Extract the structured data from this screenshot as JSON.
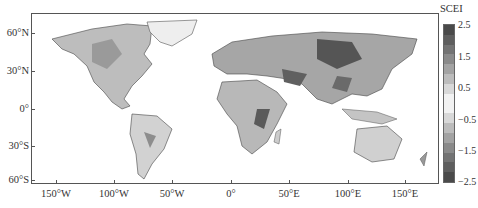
{
  "chart_data": {
    "type": "heatmap",
    "title": "",
    "xlabel": "",
    "ylabel": "",
    "x_ticks": [
      "150°W",
      "100°W",
      "50°W",
      "0°",
      "50°E",
      "100°E",
      "150°E"
    ],
    "x_tick_values": [
      -150,
      -100,
      -50,
      0,
      50,
      100,
      150
    ],
    "y_ticks": [
      "60°N",
      "30°N",
      "0°",
      "30°S",
      "60°S"
    ],
    "y_tick_values": [
      60,
      30,
      0,
      -30,
      -60
    ],
    "xlim": [
      -180,
      180
    ],
    "ylim": [
      -62,
      85
    ],
    "colorbar": {
      "title": "SCEI",
      "labels": [
        "2.5",
        "1.5",
        "0.5",
        "−0.5",
        "−1.5",
        "−2.5"
      ],
      "values": [
        2.5,
        1.5,
        0.5,
        -0.5,
        -1.5,
        -2.5
      ],
      "range": [
        -2.5,
        2.5
      ],
      "colors_top_to_bottom": [
        "#4a4a4a",
        "#5e5e5e",
        "#737373",
        "#8a8a8a",
        "#a3a3a3",
        "#bcbcbc",
        "#d8d8d8",
        "#f2f2f2",
        "#f2f2f2",
        "#d8d8d8",
        "#bcbcbc",
        "#a3a3a3",
        "#8a8a8a",
        "#737373",
        "#5e5e5e",
        "#4a4a4a"
      ]
    },
    "grid": false,
    "legend_position": "right"
  }
}
